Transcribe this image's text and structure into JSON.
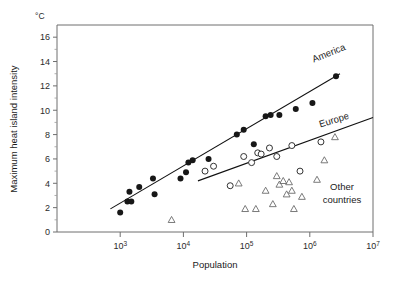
{
  "chart_data": {
    "type": "scatter",
    "title": "",
    "xlabel": "Population",
    "ylabel": "Maximum heat island intensity",
    "yunit": "°C",
    "xscale": "log",
    "xlim": [
      100,
      10000000
    ],
    "ylim": [
      0,
      17
    ],
    "grid": false,
    "legend_position": "inline-annotations",
    "xticks": [
      1000,
      10000,
      100000,
      1000000,
      10000000
    ],
    "xticklabels": [
      "10³",
      "10⁴",
      "10⁵",
      "10⁶",
      "10⁷"
    ],
    "xticklabels_parts": [
      {
        "base": "10",
        "exp": "3"
      },
      {
        "base": "10",
        "exp": "4"
      },
      {
        "base": "10",
        "exp": "5"
      },
      {
        "base": "10",
        "exp": "6"
      },
      {
        "base": "10",
        "exp": "7"
      }
    ],
    "yticks": [
      0,
      2,
      4,
      6,
      8,
      10,
      12,
      14,
      16
    ],
    "yticklabels": [
      "0",
      "2",
      "4",
      "6",
      "8",
      "10",
      "12",
      "14",
      "16"
    ],
    "yminorticks": [
      1,
      3,
      5,
      7,
      9,
      11,
      13,
      15
    ],
    "series": [
      {
        "name": "America",
        "marker": "filled-circle",
        "label": "America",
        "points": [
          {
            "x": 1000,
            "y": 1.6
          },
          {
            "x": 1300,
            "y": 2.5
          },
          {
            "x": 1400,
            "y": 3.3
          },
          {
            "x": 1500,
            "y": 2.5
          },
          {
            "x": 2000,
            "y": 3.7
          },
          {
            "x": 3300,
            "y": 4.4
          },
          {
            "x": 3500,
            "y": 3.1
          },
          {
            "x": 9000,
            "y": 4.4
          },
          {
            "x": 11000,
            "y": 4.9
          },
          {
            "x": 12000,
            "y": 5.7
          },
          {
            "x": 14000,
            "y": 5.9
          },
          {
            "x": 25000,
            "y": 6.0
          },
          {
            "x": 70000,
            "y": 8.0
          },
          {
            "x": 90000,
            "y": 8.4
          },
          {
            "x": 130000,
            "y": 7.2
          },
          {
            "x": 200000,
            "y": 9.5
          },
          {
            "x": 240000,
            "y": 9.6
          },
          {
            "x": 330000,
            "y": 9.6
          },
          {
            "x": 600000,
            "y": 10.1
          },
          {
            "x": 1100000,
            "y": 10.6
          },
          {
            "x": 2600000,
            "y": 12.8
          }
        ]
      },
      {
        "name": "Europe",
        "marker": "open-circle",
        "label": "Europe",
        "points": [
          {
            "x": 22000,
            "y": 5.0
          },
          {
            "x": 30000,
            "y": 5.4
          },
          {
            "x": 55000,
            "y": 3.8
          },
          {
            "x": 90000,
            "y": 6.2
          },
          {
            "x": 120000,
            "y": 5.7
          },
          {
            "x": 150000,
            "y": 6.5
          },
          {
            "x": 170000,
            "y": 6.4
          },
          {
            "x": 230000,
            "y": 6.9
          },
          {
            "x": 300000,
            "y": 6.2
          },
          {
            "x": 520000,
            "y": 7.1
          },
          {
            "x": 700000,
            "y": 5.0
          },
          {
            "x": 1500000,
            "y": 7.4
          }
        ]
      },
      {
        "name": "Other countries",
        "marker": "open-triangle",
        "label": "Other\ncountries",
        "label_line1": "Other",
        "label_line2": "countries",
        "points": [
          {
            "x": 6500,
            "y": 1.0
          },
          {
            "x": 75000,
            "y": 4.0
          },
          {
            "x": 95000,
            "y": 1.9
          },
          {
            "x": 140000,
            "y": 1.9
          },
          {
            "x": 200000,
            "y": 3.4
          },
          {
            "x": 260000,
            "y": 2.3
          },
          {
            "x": 300000,
            "y": 4.6
          },
          {
            "x": 330000,
            "y": 3.9
          },
          {
            "x": 380000,
            "y": 4.2
          },
          {
            "x": 430000,
            "y": 3.1
          },
          {
            "x": 470000,
            "y": 4.1
          },
          {
            "x": 520000,
            "y": 3.4
          },
          {
            "x": 560000,
            "y": 1.9
          },
          {
            "x": 750000,
            "y": 2.9
          },
          {
            "x": 1300000,
            "y": 4.3
          },
          {
            "x": 1700000,
            "y": 5.9
          },
          {
            "x": 2500000,
            "y": 7.8
          }
        ]
      }
    ],
    "trendlines": [
      {
        "name": "America",
        "x_start": 700,
        "y_start": 1.9,
        "x_end": 3000000,
        "y_end": 13.0
      },
      {
        "name": "Europe",
        "x_start": 17000,
        "y_start": 4.2,
        "x_end": 10000000,
        "y_end": 9.4
      }
    ]
  }
}
